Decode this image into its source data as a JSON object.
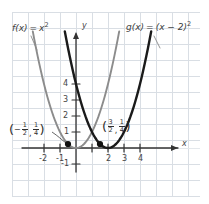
{
  "chart_data": {
    "type": "line",
    "title": "",
    "subtitle": "",
    "xlabel": "x",
    "ylabel": "y",
    "xlim": [
      -2.9,
      5.0
    ],
    "ylim": [
      -1.9,
      5.6
    ],
    "grid": true,
    "grid_step": 1,
    "legend": "inline-annotations",
    "x_ticks": [
      -2,
      -1,
      1,
      2,
      3,
      4
    ],
    "x_tick_labels": [
      "-2",
      "-1",
      "1",
      "2",
      "3",
      "4"
    ],
    "y_ticks": [
      -1,
      1,
      2,
      3,
      4
    ],
    "y_tick_labels": [
      "-1",
      "1",
      "2",
      "3",
      "4"
    ],
    "series": [
      {
        "name": "f(x) = x²",
        "expression": "x^2",
        "color": "#8c8c8c",
        "vertex": [
          0,
          0
        ],
        "x": [
          -2.45,
          -2.0,
          -1.5,
          -1.0,
          -0.5,
          0,
          0.5,
          1.0,
          1.5,
          2.0,
          2.35
        ],
        "values": [
          6.0,
          4.0,
          2.25,
          1.0,
          0.25,
          0,
          0.25,
          1.0,
          2.25,
          4.0,
          5.52
        ]
      },
      {
        "name": "g(x) = (x − 2)²",
        "expression": "(x-2)^2",
        "color": "#1a1a1a",
        "vertex": [
          2,
          0
        ],
        "x": [
          -0.35,
          0,
          0.5,
          1.0,
          1.5,
          2.0,
          2.5,
          3.0,
          3.5,
          4.0,
          4.35
        ],
        "values": [
          5.52,
          4.0,
          2.25,
          1.0,
          0.25,
          0,
          0.25,
          1.0,
          2.25,
          4.0,
          5.52
        ]
      }
    ],
    "points": [
      {
        "label": "(-1/2, 1/4)",
        "x": -0.5,
        "y": 0.25,
        "marker": "filled-circle",
        "color": "#111111"
      },
      {
        "label": "(3/2, 1/4)",
        "x": 1.5,
        "y": 0.25,
        "marker": "filled-circle",
        "color": "#111111"
      }
    ],
    "annotations": [
      {
        "name": "f-label",
        "text": "f(x) = x²",
        "fn": "f",
        "equals": "=",
        "arg": "(x)",
        "rhs": "x",
        "exponent": "2",
        "leader_line": true
      },
      {
        "name": "g-label",
        "text": "g(x) = (x − 2)²",
        "fn": "g",
        "equals": "=",
        "arg": "(x)",
        "rhs": "(x − 2)",
        "exponent": "2",
        "leader_line": true
      }
    ]
  },
  "axes": {
    "x_axis_label": "x",
    "y_axis_label": "y"
  },
  "ticks": {
    "x": [
      "-2",
      "-1",
      "2",
      "3",
      "4"
    ],
    "y": [
      "4",
      "3",
      "2",
      "1",
      "-1"
    ]
  },
  "labels": {
    "f_fn": "f",
    "f_arg": "(x)",
    "f_eq": "=",
    "f_rhs": "x",
    "f_exp": "2",
    "g_fn": "g",
    "g_arg": "(x)",
    "g_eq": "=",
    "g_rhs": "(x − 2)",
    "g_exp": "2"
  },
  "point_left": {
    "open_paren": "(",
    "minus": "−",
    "x_num": "1",
    "x_den": "2",
    "comma": ",",
    "y_num": "1",
    "y_den": "4",
    "close_paren": ")"
  },
  "point_right": {
    "open_paren": "(",
    "x_num": "3",
    "x_den": "2",
    "comma": ",",
    "y_num": "1",
    "y_den": "4",
    "close_paren": ")"
  },
  "colors": {
    "grid": "#d8dde3",
    "axis": "#333333",
    "f_curve": "#8c8c8c",
    "g_curve": "#1a1a1a",
    "point": "#111111",
    "text": "#3a3a3a",
    "background": "#ffffff"
  }
}
